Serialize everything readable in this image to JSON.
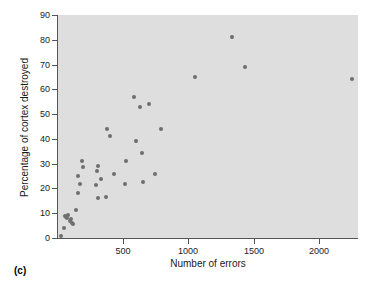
{
  "panel": {
    "label": "(c)"
  },
  "colors": {
    "plot_background": "#dedede",
    "axis": "#555555",
    "point": "#6e6e6e",
    "text": "#1a1a1a",
    "page_background": "#ffffff"
  },
  "chart_data": {
    "type": "scatter",
    "title": "",
    "subtitle": "",
    "xlabel": "Number of errors",
    "ylabel": "Percentage of cortex destroyed",
    "xlim": [
      0,
      2300
    ],
    "ylim": [
      0,
      90
    ],
    "xticks": [
      500,
      1000,
      1500,
      2000
    ],
    "xtick_labels": [
      "500",
      "1000",
      "1500",
      "2000"
    ],
    "yticks": [
      0,
      10,
      20,
      30,
      40,
      50,
      60,
      70,
      80,
      90
    ],
    "ytick_labels": [
      "0",
      "10",
      "20",
      "30",
      "40",
      "50",
      "60",
      "70",
      "80",
      "90"
    ],
    "grid": false,
    "legend": false,
    "legend_position": "none",
    "annotations": [
      "(c)"
    ],
    "series": [
      {
        "name": "rats",
        "marker": "circle",
        "color": "#6e6e6e",
        "points": [
          {
            "x": 20,
            "y": 1
          },
          {
            "x": 45,
            "y": 4
          },
          {
            "x": 55,
            "y": 9
          },
          {
            "x": 60,
            "y": 8.5
          },
          {
            "x": 70,
            "y": 8
          },
          {
            "x": 75,
            "y": 9.5
          },
          {
            "x": 90,
            "y": 7
          },
          {
            "x": 100,
            "y": 7.5
          },
          {
            "x": 110,
            "y": 6
          },
          {
            "x": 115,
            "y": 5.5
          },
          {
            "x": 140,
            "y": 11.5
          },
          {
            "x": 150,
            "y": 18
          },
          {
            "x": 155,
            "y": 25
          },
          {
            "x": 170,
            "y": 22
          },
          {
            "x": 180,
            "y": 31
          },
          {
            "x": 195,
            "y": 28.5
          },
          {
            "x": 290,
            "y": 21.5
          },
          {
            "x": 300,
            "y": 27
          },
          {
            "x": 305,
            "y": 29
          },
          {
            "x": 310,
            "y": 16
          },
          {
            "x": 330,
            "y": 24
          },
          {
            "x": 370,
            "y": 16.5
          },
          {
            "x": 375,
            "y": 44
          },
          {
            "x": 400,
            "y": 41
          },
          {
            "x": 430,
            "y": 26
          },
          {
            "x": 510,
            "y": 22
          },
          {
            "x": 520,
            "y": 31
          },
          {
            "x": 580,
            "y": 57
          },
          {
            "x": 600,
            "y": 39
          },
          {
            "x": 630,
            "y": 53
          },
          {
            "x": 640,
            "y": 34.5
          },
          {
            "x": 650,
            "y": 22.5
          },
          {
            "x": 700,
            "y": 54
          },
          {
            "x": 740,
            "y": 26
          },
          {
            "x": 790,
            "y": 44
          },
          {
            "x": 1050,
            "y": 65
          },
          {
            "x": 1330,
            "y": 81
          },
          {
            "x": 1430,
            "y": 69
          },
          {
            "x": 2250,
            "y": 64
          }
        ]
      }
    ]
  }
}
